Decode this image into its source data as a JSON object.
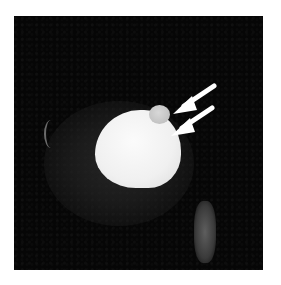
{
  "figure": {
    "type": "MRI scan",
    "background_color": "#060606",
    "page_color": "#ffffff",
    "annotations": [
      {
        "kind": "arrow",
        "direction": "down-left",
        "points_to": "small round lesion",
        "color": "#ffffff"
      },
      {
        "kind": "arrow",
        "direction": "down-left",
        "points_to": "junction of small lesion and main mass",
        "color": "#ffffff"
      }
    ],
    "structures": [
      {
        "name": "large bright mass",
        "color": "#f0f0f0"
      },
      {
        "name": "small round bright nodule",
        "color": "#c8c8c8"
      },
      {
        "name": "faint vertical bright structure (lower right)",
        "color": "#4a4a4a"
      },
      {
        "name": "thin curved bright line (left)",
        "color": "#6a6a6a"
      }
    ]
  }
}
